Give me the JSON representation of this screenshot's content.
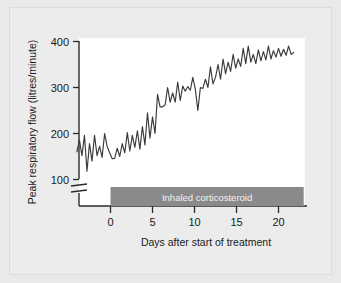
{
  "figure": {
    "background_color": "#e9e9e9",
    "panel_color": "#ececec",
    "plot_background": "#ffffff"
  },
  "chart_data": {
    "type": "line",
    "title": "",
    "xlabel": "Days after start of treatment",
    "ylabel": "Peak respiratory flow (litres/minute)",
    "xlim": [
      -4.2,
      23.2
    ],
    "ylim": [
      80,
      410
    ],
    "y_axis_break": true,
    "y_break_below": 100,
    "grid": false,
    "legend": null,
    "line_color": "#3a3a3a",
    "xticks": [
      0,
      5,
      10,
      15,
      20
    ],
    "xtick_labels": [
      "0",
      "5",
      "10",
      "15",
      "20"
    ],
    "yticks": [
      100,
      200,
      300,
      400
    ],
    "ytick_labels": [
      "100",
      "200",
      "300",
      "400"
    ],
    "annotation": {
      "text": "Inhaled corticosteroid",
      "type": "span-bar",
      "x_start": 0,
      "x_end": 23,
      "color": "#8a8a8a",
      "text_color": "#f2f2f2"
    },
    "series": [
      {
        "name": "Peak respiratory flow",
        "x": [
          -4.0,
          -3.7,
          -3.4,
          -3.1,
          -2.8,
          -2.5,
          -2.2,
          -1.9,
          -1.6,
          -1.3,
          -1.0,
          -0.7,
          -0.4,
          -0.1,
          0.2,
          0.5,
          0.8,
          1.1,
          1.4,
          1.7,
          2.0,
          2.3,
          2.6,
          2.9,
          3.2,
          3.5,
          3.8,
          4.1,
          4.4,
          4.7,
          5.0,
          5.3,
          5.6,
          5.9,
          6.2,
          6.5,
          6.8,
          7.1,
          7.4,
          7.7,
          8.0,
          8.3,
          8.6,
          8.9,
          9.2,
          9.5,
          9.8,
          10.1,
          10.4,
          10.7,
          11.0,
          11.3,
          11.6,
          11.9,
          12.2,
          12.5,
          12.8,
          13.1,
          13.4,
          13.7,
          14.0,
          14.3,
          14.6,
          14.9,
          15.2,
          15.5,
          15.8,
          16.1,
          16.4,
          16.7,
          17.0,
          17.3,
          17.6,
          17.9,
          18.2,
          18.5,
          18.8,
          19.1,
          19.4,
          19.7,
          20.0,
          20.3,
          20.6,
          20.9,
          21.2,
          21.5,
          21.8
        ],
        "values": [
          160,
          186,
          152,
          196,
          118,
          178,
          140,
          196,
          152,
          172,
          148,
          200,
          172,
          158,
          145,
          146,
          168,
          150,
          178,
          158,
          202,
          162,
          196,
          170,
          206,
          166,
          215,
          175,
          245,
          190,
          236,
          200,
          285,
          258,
          258,
          262,
          300,
          268,
          288,
          268,
          312,
          272,
          303,
          292,
          302,
          294,
          322,
          296,
          250,
          300,
          298,
          318,
          300,
          345,
          308,
          322,
          350,
          318,
          362,
          330,
          355,
          335,
          372,
          342,
          362,
          346,
          385,
          352,
          390,
          355,
          372,
          352,
          382,
          358,
          378,
          360,
          390,
          362,
          380,
          366,
          385,
          368,
          383,
          370,
          390,
          372,
          376
        ]
      }
    ]
  }
}
